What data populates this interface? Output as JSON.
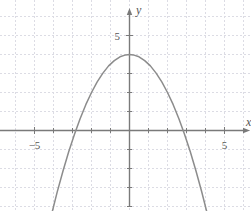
{
  "chart_data": {
    "type": "line",
    "title": "",
    "subtitle": "",
    "xlabel": "x",
    "ylabel": "y",
    "equation": "y = 4 - 0.5x^2",
    "xlim": [
      -6.8,
      6.5
    ],
    "ylim": [
      -4.2,
      6.9
    ],
    "grid": true,
    "grid_step": 1,
    "legend": "none",
    "x_tick_labels": [
      {
        "value": -5,
        "text": "−5"
      },
      {
        "value": 5,
        "text": "5"
      }
    ],
    "y_tick_labels": [
      {
        "value": 5,
        "text": "5"
      }
    ],
    "axis_arrow_x": "right",
    "axis_arrow_y": "up",
    "series": [
      {
        "name": "parabola",
        "kind": "parabola",
        "vertex": [
          0,
          4
        ],
        "a": -0.5,
        "roots": [
          -2.83,
          2.83
        ],
        "x": [
          -4.7,
          -4.4,
          -4.1,
          -3.8,
          -3.5,
          -3.2,
          -2.9,
          -2.6,
          -2.3,
          -2.0,
          -1.7,
          -1.4,
          -1.1,
          -0.8,
          -0.5,
          -0.2,
          0.0,
          0.2,
          0.5,
          0.8,
          1.1,
          1.4,
          1.7,
          2.0,
          2.3,
          2.6,
          2.9,
          3.2,
          3.5,
          3.8,
          4.1,
          4.4,
          4.7
        ],
        "y": [
          -7.05,
          -5.68,
          -4.41,
          -3.22,
          -2.13,
          -1.12,
          -0.21,
          0.62,
          1.36,
          2.0,
          2.56,
          3.02,
          3.4,
          3.68,
          3.88,
          3.98,
          4.0,
          3.98,
          3.88,
          3.68,
          3.4,
          3.02,
          2.56,
          2.0,
          1.36,
          0.62,
          -0.21,
          -1.12,
          -2.13,
          -3.22,
          -4.41,
          -5.68,
          -7.05
        ]
      }
    ]
  },
  "style": {
    "curve_color": "#8c8c8c",
    "axis_color": "#7a7a7a",
    "grid_color": "#dcdce4",
    "label_color": "#555555",
    "background": "#ffffff"
  }
}
